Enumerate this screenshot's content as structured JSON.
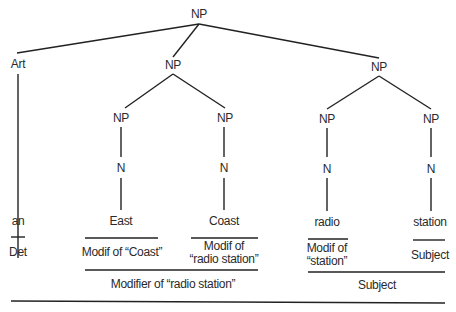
{
  "diagram": {
    "type": "syntax-tree",
    "nodes": {
      "root": "NP",
      "art": "Art",
      "np_left": "NP",
      "np_right": "NP",
      "np_east": "NP",
      "np_coast": "NP",
      "np_radio": "NP",
      "np_station": "NP",
      "n_east": "N",
      "n_coast": "N",
      "n_radio": "N",
      "n_station": "N"
    },
    "words": {
      "an": "an",
      "east": "East",
      "coast": "Coast",
      "radio": "radio",
      "station": "station"
    },
    "annotations": {
      "det": "Det",
      "modif_coast": "Modif of “Coast”",
      "modif_radio_station_1": "Modif of",
      "modif_radio_station_2": "“radio station”",
      "modif_station_1": "Modif of",
      "modif_station_2": "“station”",
      "subject_small": "Subject",
      "modifier_radio_station": "Modifier of “radio station”",
      "subject_large": "Subject"
    },
    "line_color": "#222222"
  }
}
